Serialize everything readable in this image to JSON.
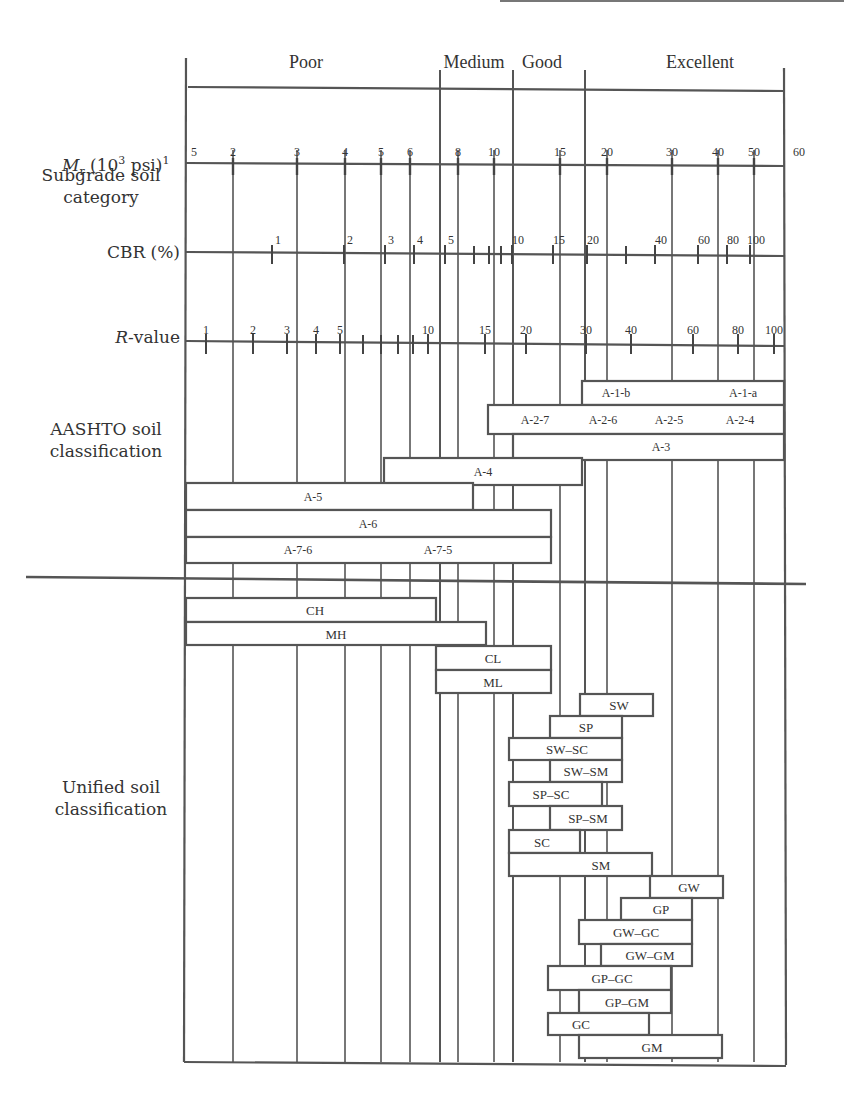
{
  "row_labels": {
    "subgrade": [
      "Subgrade soil",
      "category"
    ],
    "mr": "M",
    "mr_sub": "r",
    "mr_rest": " (10",
    "mr_sup": "3",
    "mr_unit": " psi)",
    "mr_note": "1",
    "cbr": "CBR (%)",
    "rvalue_italic": "R",
    "rvalue_rest": "-value",
    "aashto": [
      "AASHTO soil",
      "classification"
    ],
    "unified": [
      "Unified soil",
      "classification"
    ]
  },
  "categories": [
    {
      "label": "Poor",
      "x1": 186,
      "x2": 440,
      "label_x": 306
    },
    {
      "label": "Medium",
      "x1": 440,
      "x2": 513,
      "label_x": 474
    },
    {
      "label": "Good",
      "x1": 513,
      "x2": 585,
      "label_x": 542
    },
    {
      "label": "Excellent",
      "x1": 585,
      "x2": 784,
      "label_x": 700
    }
  ],
  "chart_data": {
    "type": "table",
    "scales": {
      "Mr_10^3_psi": {
        "ticks": [
          {
            "v": "1.5",
            "label": "5",
            "x": 190
          },
          {
            "v": 2,
            "x": 233
          },
          {
            "v": 3,
            "x": 297
          },
          {
            "v": 4,
            "x": 345
          },
          {
            "v": 5,
            "x": 381
          },
          {
            "v": 6,
            "x": 410
          },
          {
            "v": 8,
            "x": 458
          },
          {
            "v": 10,
            "x": 494
          },
          {
            "v": 15,
            "x": 560
          },
          {
            "v": 20,
            "x": 607
          },
          {
            "v": 30,
            "x": 672
          },
          {
            "v": 40,
            "x": 718
          },
          {
            "v": 50,
            "x": 754
          },
          {
            "v": 60,
            "x": 795
          }
        ]
      },
      "CBR_percent": {
        "labeled": [
          {
            "v": 1,
            "x": 272
          },
          {
            "v": 2,
            "x": 344
          },
          {
            "v": 3,
            "x": 385
          },
          {
            "v": 4,
            "x": 414
          },
          {
            "v": 5,
            "x": 445
          },
          {
            "v": 10,
            "x": 512
          },
          {
            "v": 15,
            "x": 553
          },
          {
            "v": 20,
            "x": 587
          },
          {
            "v": 40,
            "x": 655
          },
          {
            "v": 60,
            "x": 698
          },
          {
            "v": 80,
            "x": 727
          },
          {
            "v": 100,
            "x": 750
          }
        ],
        "minor_x": [
          474,
          489,
          501,
          626
        ]
      },
      "R_value": {
        "labeled": [
          {
            "v": 1,
            "x": 206
          },
          {
            "v": 2,
            "x": 253
          },
          {
            "v": 3,
            "x": 287
          },
          {
            "v": 4,
            "x": 316
          },
          {
            "v": 5,
            "x": 340
          },
          {
            "v": 10,
            "x": 428
          },
          {
            "v": 15,
            "x": 485
          },
          {
            "v": 20,
            "x": 526
          },
          {
            "v": 30,
            "x": 586
          },
          {
            "v": 40,
            "x": 631
          },
          {
            "v": 60,
            "x": 693
          },
          {
            "v": 80,
            "x": 738
          },
          {
            "v": 100,
            "x": 774
          }
        ],
        "minor_x": [
          363,
          381,
          398,
          413
        ]
      }
    },
    "aashto": [
      {
        "labels": [
          {
            "t": "A-1-b",
            "x": 542
          },
          {
            "t": "A-1-a",
            "x": 465
          }
        ],
        "x1": 582,
        "x2": 784,
        "y1": 381,
        "y2": 405
      },
      {
        "labels": [
          {
            "t": "A-2-7",
            "x": 535
          },
          {
            "t": "A-2-6",
            "x": 603
          },
          {
            "t": "A-2-5",
            "x": 669
          },
          {
            "t": "A-2-4",
            "x": 740
          }
        ],
        "x1": 488,
        "x2": 784,
        "y1": 405,
        "y2": 434
      },
      {
        "labels": [
          {
            "t": "A-3",
            "x": 661
          }
        ],
        "x1": 513,
        "x2": 784,
        "y1": 434,
        "y2": 460
      },
      {
        "labels": [
          {
            "t": "A-4",
            "x": 483
          }
        ],
        "x1": 384,
        "x2": 582,
        "y1": 458,
        "y2": 485
      },
      {
        "labels": [
          {
            "t": "A-5",
            "x": 313
          }
        ],
        "x1": 186,
        "x2": 473,
        "y1": 483,
        "y2": 510
      },
      {
        "labels": [
          {
            "t": "A-6",
            "x": 368
          }
        ],
        "x1": 186,
        "x2": 551,
        "y1": 510,
        "y2": 537
      },
      {
        "labels": [
          {
            "t": "A-7-6",
            "x": 298
          },
          {
            "t": "A-7-5",
            "x": 438
          }
        ],
        "x1": 186,
        "x2": 551,
        "y1": 537,
        "y2": 563
      }
    ],
    "unified": [
      {
        "t": "CH",
        "x1": 186,
        "x2": 436,
        "y1": 598,
        "y2": 622,
        "lx": 315
      },
      {
        "t": "MH",
        "x1": 186,
        "x2": 486,
        "y1": 622,
        "y2": 645,
        "lx": 336
      },
      {
        "t": "CL",
        "x1": 436,
        "x2": 551,
        "y1": 646,
        "y2": 670,
        "lx": 493
      },
      {
        "t": "ML",
        "x1": 436,
        "x2": 551,
        "y1": 670,
        "y2": 693,
        "lx": 493
      },
      {
        "t": "SW",
        "x1": 580,
        "x2": 653,
        "y1": 694,
        "y2": 716,
        "lx": 619
      },
      {
        "t": "SP",
        "x1": 550,
        "x2": 622,
        "y1": 716,
        "y2": 738,
        "lx": 586
      },
      {
        "t": "SW–SC",
        "x1": 509,
        "x2": 622,
        "y1": 738,
        "y2": 760,
        "lx": 567
      },
      {
        "t": "SW–SM",
        "x1": 550,
        "x2": 622,
        "y1": 760,
        "y2": 782,
        "lx": 586
      },
      {
        "t": "SP–SC",
        "x1": 509,
        "x2": 602,
        "y1": 782,
        "y2": 806,
        "lx": 551
      },
      {
        "t": "SP–SM",
        "x1": 550,
        "x2": 622,
        "y1": 806,
        "y2": 830,
        "lx": 588
      },
      {
        "t": "SC",
        "x1": 509,
        "x2": 580,
        "y1": 830,
        "y2": 853,
        "lx": 542
      },
      {
        "t": "SM",
        "x1": 509,
        "x2": 652,
        "y1": 853,
        "y2": 876,
        "lx": 601
      },
      {
        "t": "GW",
        "x1": 650,
        "x2": 723,
        "y1": 876,
        "y2": 898,
        "lx": 689
      },
      {
        "t": "GP",
        "x1": 621,
        "x2": 692,
        "y1": 898,
        "y2": 920,
        "lx": 661
      },
      {
        "t": "GW–GC",
        "x1": 579,
        "x2": 692,
        "y1": 920,
        "y2": 944,
        "lx": 636
      },
      {
        "t": "GW–GM",
        "x1": 601,
        "x2": 692,
        "y1": 944,
        "y2": 966,
        "lx": 650
      },
      {
        "t": "GP–GC",
        "x1": 548,
        "x2": 671,
        "y1": 966,
        "y2": 990,
        "lx": 612
      },
      {
        "t": "GP–GM",
        "x1": 579,
        "x2": 671,
        "y1": 990,
        "y2": 1013,
        "lx": 627
      },
      {
        "t": "GC",
        "x1": 548,
        "x2": 649,
        "y1": 1013,
        "y2": 1035,
        "lx": 581
      },
      {
        "t": "GM",
        "x1": 579,
        "x2": 722,
        "y1": 1035,
        "y2": 1058,
        "lx": 652
      }
    ]
  }
}
